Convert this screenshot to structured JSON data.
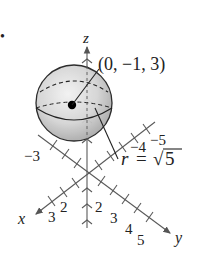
{
  "figure": {
    "bullet": "•",
    "axes": {
      "x_label": "x",
      "y_label": "y",
      "z_label": "z",
      "x_ticks": [
        "2",
        "3"
      ],
      "x_neg_ticks": [
        "−3"
      ],
      "y_ticks": [
        "2",
        "3",
        "4",
        "5"
      ],
      "y_neg_ticks": [
        "−4",
        "−5"
      ]
    },
    "sphere": {
      "center_label": "(0, −1, 3)",
      "radius_label_r": "r",
      "radius_label_eq": "=",
      "radius_label_sqrt": "√",
      "radius_label_val": "5"
    },
    "colors": {
      "axis": "#555555",
      "sphere_fill_light": "#eeeeee",
      "sphere_fill_dark": "#a9a9a9",
      "outline": "#222222"
    }
  }
}
